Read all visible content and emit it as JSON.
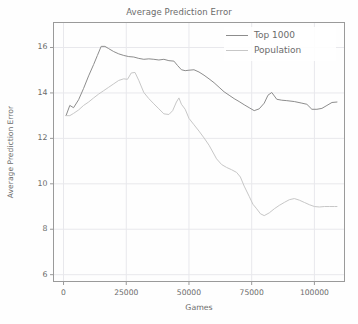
{
  "chart_data": {
    "type": "line",
    "title": "Average Prediction Error",
    "xlabel": "Games",
    "ylabel": "Average Prediction Error",
    "xlim": [
      -4000,
      112000
    ],
    "ylim": [
      5.7,
      17.1
    ],
    "xticks": [
      0,
      25000,
      50000,
      75000,
      100000
    ],
    "xtick_labels": [
      "0",
      "25000",
      "50000",
      "75000",
      "100000"
    ],
    "yticks": [
      6,
      8,
      10,
      12,
      14,
      16
    ],
    "ytick_labels": [
      "6",
      "8",
      "10",
      "12",
      "14",
      "16"
    ],
    "grid": true,
    "grid_color": "#e8e8ec",
    "legend_position": "upper right",
    "series": [
      {
        "name": "Top 1000",
        "color": "#8d8d8d",
        "x": [
          1000,
          2500,
          4000,
          6000,
          8000,
          10000,
          12000,
          13500,
          15000,
          16500,
          18000,
          20000,
          22000,
          24000,
          26000,
          28000,
          30000,
          32000,
          34000,
          36000,
          38000,
          40000,
          42000,
          44000,
          45500,
          47000,
          48500,
          50000,
          52000,
          54000,
          56000,
          58000,
          60000,
          62000,
          64000,
          66000,
          68000,
          70000,
          72000,
          74000,
          76000,
          78000,
          80000,
          81500,
          83000,
          85000,
          87000,
          89000,
          92000,
          95000,
          97000,
          99000,
          101000,
          103000,
          105000,
          107000,
          109000
        ],
        "values": [
          13.0,
          13.45,
          13.35,
          13.7,
          14.2,
          14.75,
          15.25,
          15.65,
          16.05,
          16.05,
          15.95,
          15.82,
          15.72,
          15.65,
          15.6,
          15.58,
          15.52,
          15.48,
          15.5,
          15.48,
          15.45,
          15.48,
          15.42,
          15.4,
          15.2,
          15.02,
          14.98,
          15.0,
          15.02,
          14.92,
          14.78,
          14.62,
          14.45,
          14.25,
          14.05,
          13.9,
          13.75,
          13.62,
          13.48,
          13.35,
          13.22,
          13.3,
          13.55,
          13.9,
          14.02,
          13.72,
          13.68,
          13.66,
          13.62,
          13.55,
          13.5,
          13.28,
          13.28,
          13.32,
          13.45,
          13.58,
          13.6
        ]
      },
      {
        "name": "Population",
        "color": "#c7c7c7",
        "x": [
          1000,
          2500,
          4000,
          6000,
          8000,
          10000,
          12000,
          14000,
          16000,
          18000,
          20000,
          22000,
          24000,
          25500,
          27000,
          28500,
          30000,
          32000,
          34000,
          36000,
          38000,
          40000,
          42000,
          43500,
          45000,
          46000,
          47000,
          48500,
          50000,
          52000,
          54000,
          56000,
          58000,
          59500,
          61000,
          63000,
          65000,
          67000,
          69000,
          70500,
          72000,
          74000,
          75500,
          77000,
          78500,
          80000,
          82000,
          84000,
          86000,
          88000,
          90000,
          92000,
          94000,
          96000,
          98000,
          100000,
          102000,
          104000,
          106000,
          108000,
          109000
        ],
        "values": [
          13.0,
          13.0,
          13.1,
          13.25,
          13.45,
          13.6,
          13.78,
          13.95,
          14.1,
          14.25,
          14.4,
          14.55,
          14.62,
          14.6,
          14.88,
          14.9,
          14.55,
          14.02,
          13.75,
          13.52,
          13.3,
          13.08,
          13.05,
          13.22,
          13.6,
          13.78,
          13.5,
          13.28,
          12.88,
          12.6,
          12.32,
          12.02,
          11.7,
          11.4,
          11.1,
          10.85,
          10.72,
          10.62,
          10.5,
          10.3,
          9.9,
          9.45,
          9.1,
          8.9,
          8.68,
          8.6,
          8.72,
          8.9,
          9.05,
          9.18,
          9.3,
          9.35,
          9.28,
          9.18,
          9.08,
          9.0,
          8.98,
          9.0,
          9.0,
          9.0,
          9.0
        ]
      }
    ]
  },
  "legend": {
    "items": [
      {
        "label": "Top 1000"
      },
      {
        "label": "Population"
      }
    ]
  }
}
